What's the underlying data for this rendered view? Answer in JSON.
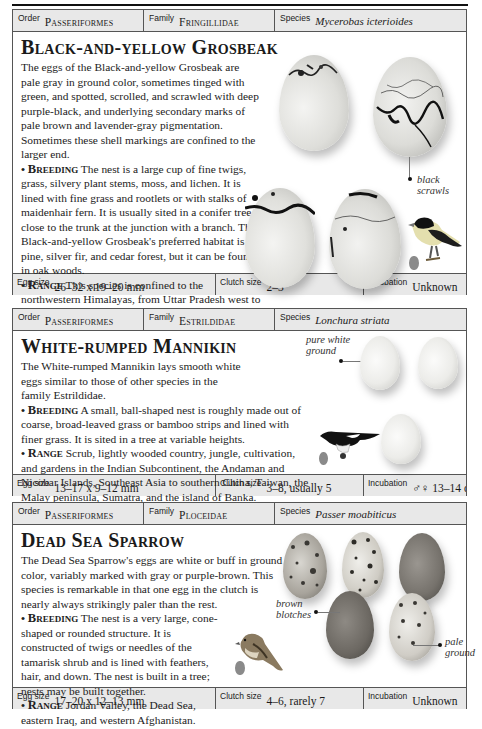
{
  "entries": [
    {
      "order_label": "Order",
      "order": "Passeriformes",
      "family_label": "Family",
      "family": "Fringillidae",
      "species_label": "Species",
      "species": "Mycerobas icterioides",
      "title": "Black-and-yellow Grosbeak",
      "description": "The eggs of the Black-and-yellow Grosbeak are pale gray in ground color, sometimes tinged with green, and spotted, scrolled, and scrawled with deep purple-black, and underlying secondary marks of pale brown and lavender-gray pigmentation. Sometimes these shell markings are confined to the larger end.",
      "breeding_label": "Breeding",
      "breeding": "The nest is a large cup of fine twigs, grass, silvery plant stems, moss, and lichen. It is lined with fine grass and rootlets or with stalks of maidenhair fern. It is usually sited in a conifer tree, close to the trunk at the junction with a branch. The Black-and-yellow Grosbeak's preferred habitat is pine, silver fir, and cedar forest, but it can be found in oak woods.",
      "range_label": "Range",
      "range": "This species is confined to the northwestern Himalayas, from Uttar Pradesh west to northeastern Afghanistan.",
      "callouts": [
        "black scrawls"
      ],
      "egg_size_label": "Egg size",
      "egg_size": "26–32 x 19–20 mm",
      "clutch_size_label": "Clutch size",
      "clutch_size": "2–3",
      "incubation_label": "Incubation",
      "incubation": "Unknown"
    },
    {
      "order_label": "Order",
      "order": "Passeriformes",
      "family_label": "Family",
      "family": "Estrildidae",
      "species_label": "Species",
      "species": "Lonchura striata",
      "title": "White-rumped Mannikin",
      "description": "The White-rumped Mannikin lays smooth white eggs similar to those of other species in the family Estrildidae.",
      "breeding_label": "Breeding",
      "breeding": "A small, ball-shaped nest is roughly made out of coarse, broad-leaved grass or bamboo strips and lined with finer grass. It is sited in a tree at variable heights.",
      "range_label": "Range",
      "range": "Scrub, lightly wooded country, jungle, cultivation, and gardens in the Indian Subcontinent, the Andaman and Nicobar Islands, Southeast Asia to southern China, Taiwan, the Malay peninsula, Sumatra, and the island of Banka.",
      "callouts": [
        "pure white ground"
      ],
      "egg_size_label": "Egg size",
      "egg_size": "13–17 x 9–12 mm",
      "clutch_size_label": "Clutch size",
      "clutch_size": "3–8, usually 5",
      "incubation_label": "Incubation",
      "incubation": "♂♀ 13–14 days"
    },
    {
      "order_label": "Order",
      "order": "Passeriformes",
      "family_label": "Family",
      "family": "Ploceidae",
      "species_label": "Species",
      "species": "Passer moabiticus",
      "title": "Dead Sea Sparrow",
      "description": "The Dead Sea Sparrow's eggs are white or buff in ground color, variably marked with gray or purple-brown. This species is remarkable in that one egg in the clutch is nearly always strikingly paler than the rest.",
      "breeding_label": "Breeding",
      "breeding": "The nest is a very large, cone-shaped or rounded structure. It is constructed of twigs or needles of the tamarisk shrub and is lined with feathers, hair, and down. The nest is built in a tree; nests may be built together.",
      "range_label": "Range",
      "range": "Jordan Valley, the Dead Sea, eastern Iraq, and western Afghanistan.",
      "callouts": [
        "brown blotches",
        "pale ground"
      ],
      "egg_size_label": "Egg size",
      "egg_size": "17–20 x 12–13 mm",
      "clutch_size_label": "Clutch size",
      "clutch_size": "4–6, rarely 7",
      "incubation_label": "Incubation",
      "incubation": "Unknown"
    }
  ],
  "colors": {
    "header_bg": "#e8e8e8",
    "border": "#555555",
    "text": "#1a1a1a"
  }
}
